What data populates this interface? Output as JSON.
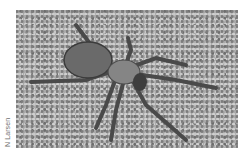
{
  "image": {
    "subject": "spider on sand",
    "tone": "grayscale",
    "background_color": "#a9a9a9"
  },
  "credit": {
    "text": "N Larsen"
  }
}
